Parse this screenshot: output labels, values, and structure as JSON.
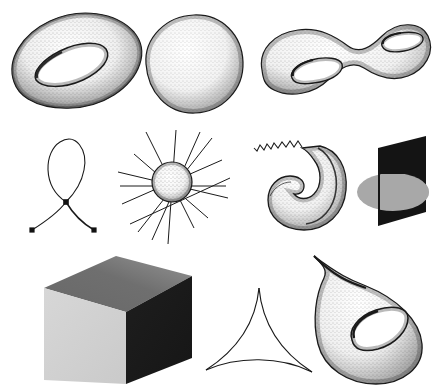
{
  "sheet": {
    "title": "Mathematical surfaces and curves plate",
    "background_color": "#ffffff",
    "ink_color": "#1a1a1a",
    "width": 433,
    "height": 388,
    "rows": 3,
    "figure_count": 9
  },
  "palette": {
    "ink": "#1a1a1a",
    "stipple": "#2a2a2a",
    "cube_front": "#d2d2d2",
    "cube_top_dark": "#595959",
    "cube_top_light": "#9a9a9a",
    "cube_right": "#1d1d1d",
    "plane_black": "#141414",
    "disc_grey": "#a8a8a8",
    "white": "#ffffff"
  },
  "figures": [
    {
      "id": "torus",
      "name": "torus",
      "label": "Torus (genus 1 surface)",
      "row": 1,
      "column": 1,
      "style": "stippled shaded surface",
      "x": 4,
      "y": 8,
      "w": 146,
      "h": 112
    },
    {
      "id": "sphere",
      "name": "sphere",
      "label": "Sphere (genus 0 surface)",
      "row": 1,
      "column": 2,
      "style": "stippled shaded surface",
      "x": 138,
      "y": 8,
      "w": 110,
      "h": 110
    },
    {
      "id": "genus-two-surface",
      "name": "double-torus",
      "label": "Genus 2 surface (double torus)",
      "row": 1,
      "column": 3,
      "style": "stippled shaded surface",
      "x": 256,
      "y": 8,
      "w": 176,
      "h": 112
    },
    {
      "id": "nodal-curve",
      "name": "nodal-curve",
      "label": "Nodal curve with one double point",
      "row": 2,
      "column": 1,
      "style": "line drawing with marked points",
      "node_count": 1,
      "endpoint_count": 2,
      "x": 22,
      "y": 134,
      "w": 84,
      "h": 104
    },
    {
      "id": "blowup-sphere",
      "name": "radiating-lines-sphere",
      "label": "Small sphere pierced by radiating lines",
      "row": 2,
      "column": 2,
      "style": "stippled ball with straight rays",
      "ray_count": 9,
      "x": 116,
      "y": 128,
      "w": 116,
      "h": 118
    },
    {
      "id": "cuspidal-horn",
      "name": "cuspidal-horn",
      "label": "Horn surface with zigzag tail",
      "row": 2,
      "column": 3,
      "style": "stippled surface with wavy line",
      "x": 256,
      "y": 136,
      "w": 104,
      "h": 100
    },
    {
      "id": "plane-disc-intersection",
      "name": "plane-disc-intersection",
      "label": "Black plane intersecting a grey disc",
      "row": 2,
      "column": 4,
      "style": "solid filled silhouettes",
      "x": 352,
      "y": 136,
      "w": 80,
      "h": 104
    },
    {
      "id": "cube",
      "name": "cube",
      "label": "Shaded cube",
      "row": 3,
      "column": 1,
      "style": "three-tone solid",
      "x": 44,
      "y": 254,
      "w": 148,
      "h": 130
    },
    {
      "id": "deltoid",
      "name": "deltoid-curve",
      "label": "Deltoid with three cusps",
      "row": 3,
      "column": 2,
      "style": "line drawing",
      "cusp_count": 3,
      "x": 204,
      "y": 288,
      "w": 110,
      "h": 92
    },
    {
      "id": "teardrop-torus",
      "name": "teardrop-torus",
      "label": "Cuspidal teardrop torus",
      "row": 3,
      "column": 3,
      "style": "stippled shaded surface",
      "x": 306,
      "y": 252,
      "w": 126,
      "h": 134
    }
  ]
}
